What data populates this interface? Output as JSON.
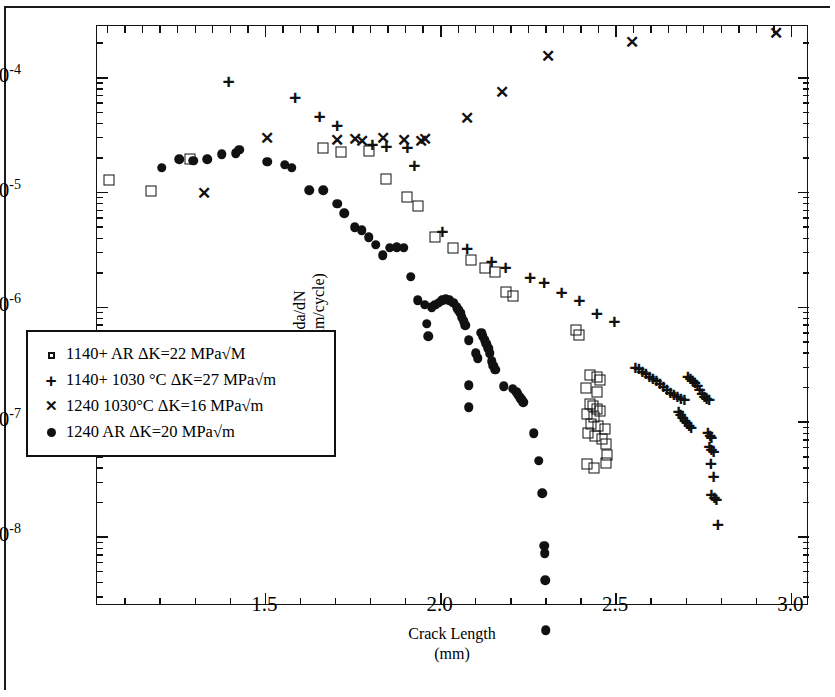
{
  "chart_data": {
    "type": "scatter",
    "title": "",
    "xlabel": "Crack Length",
    "xlabel_unit": "(mm)",
    "ylabel": "da/dN",
    "ylabel_unit": "(mm/cycle)",
    "xlim": [
      1.02,
      3.05
    ],
    "ylim_exp": [
      -8.6,
      -3.55
    ],
    "xscale": "linear",
    "yscale": "log",
    "grid": false,
    "legend_position": "lower-left-inside",
    "x_ticks_major": [
      1.5,
      2.0,
      2.5,
      3.0
    ],
    "x_tick_labels": [
      "1.5",
      "2.0",
      "2.5",
      "3.0"
    ],
    "x_ticks_minor": [
      1.1,
      1.2,
      1.3,
      1.4,
      1.6,
      1.7,
      1.8,
      1.9,
      2.1,
      2.2,
      2.3,
      2.4,
      2.6,
      2.7,
      2.8,
      2.9
    ],
    "y_ticks_major_exp": [
      -4,
      -5,
      -6,
      -7,
      -8
    ],
    "y_tick_labels": [
      "10-4",
      "10-5",
      "10-6",
      "10-7",
      "10-8"
    ],
    "series": [
      {
        "name": "1140+ AR ΔK=22 MPa√M",
        "marker": "open-square",
        "points": [
          [
            1.055,
            1.28e-05
          ],
          [
            1.175,
            1.03e-05
          ],
          [
            1.285,
            1.95e-05
          ],
          [
            1.665,
            2.45e-05
          ],
          [
            1.715,
            2.25e-05
          ],
          [
            1.795,
            2.3e-05
          ],
          [
            1.845,
            1.3e-05
          ],
          [
            1.905,
            9.2e-06
          ],
          [
            1.935,
            7.6e-06
          ],
          [
            1.985,
            4.1e-06
          ],
          [
            2.035,
            3.3e-06
          ],
          [
            2.085,
            2.6e-06
          ],
          [
            2.125,
            2.2e-06
          ],
          [
            2.155,
            2.05e-06
          ],
          [
            2.185,
            1.35e-06
          ],
          [
            2.205,
            1.25e-06
          ],
          [
            2.385,
            6.4e-07
          ],
          [
            2.395,
            5.8e-07
          ],
          [
            2.425,
            2.6e-07
          ],
          [
            2.445,
            2.5e-07
          ],
          [
            2.455,
            2.35e-07
          ],
          [
            2.415,
            2e-07
          ],
          [
            2.445,
            1.85e-07
          ],
          [
            2.425,
            1.45e-07
          ],
          [
            2.435,
            1.38e-07
          ],
          [
            2.445,
            1.3e-07
          ],
          [
            2.455,
            1.26e-07
          ],
          [
            2.418,
            1.18e-07
          ],
          [
            2.438,
            1.12e-07
          ],
          [
            2.428,
            9.6e-08
          ],
          [
            2.448,
            9.2e-08
          ],
          [
            2.468,
            8.8e-08
          ],
          [
            2.42,
            8e-08
          ],
          [
            2.44,
            7.6e-08
          ],
          [
            2.46,
            7.2e-08
          ],
          [
            2.472,
            6.4e-08
          ],
          [
            2.475,
            5.2e-08
          ],
          [
            2.418,
            4.3e-08
          ],
          [
            2.438,
            4e-08
          ],
          [
            2.472,
            4.4e-08
          ]
        ]
      },
      {
        "name": "1140+ 1030 °C ΔK=27 MPa√m",
        "marker": "plus",
        "points": [
          [
            1.395,
            9.3e-05
          ],
          [
            1.585,
            6.8e-05
          ],
          [
            1.655,
            4.6e-05
          ],
          [
            1.705,
            3.9e-05
          ],
          [
            1.805,
            2.65e-05
          ],
          [
            1.845,
            2.55e-05
          ],
          [
            1.905,
            2.5e-05
          ],
          [
            1.925,
            1.75e-05
          ],
          [
            2.005,
            4.6e-06
          ],
          [
            2.075,
            3.3e-06
          ],
          [
            2.145,
            2.55e-06
          ],
          [
            2.185,
            2.25e-06
          ],
          [
            2.255,
            1.85e-06
          ],
          [
            2.295,
            1.65e-06
          ],
          [
            2.345,
            1.35e-06
          ],
          [
            2.395,
            1.15e-06
          ],
          [
            2.445,
            9e-07
          ],
          [
            2.495,
            7.6e-07
          ],
          [
            2.555,
            3.05e-07
          ],
          [
            2.565,
            2.95e-07
          ],
          [
            2.575,
            2.8e-07
          ],
          [
            2.585,
            2.7e-07
          ],
          [
            2.595,
            2.55e-07
          ],
          [
            2.605,
            2.45e-07
          ],
          [
            2.615,
            2.35e-07
          ],
          [
            2.625,
            2.2e-07
          ],
          [
            2.635,
            2.05e-07
          ],
          [
            2.645,
            1.95e-07
          ],
          [
            2.655,
            1.85e-07
          ],
          [
            2.665,
            1.75e-07
          ],
          [
            2.675,
            1.7e-07
          ],
          [
            2.685,
            1.62e-07
          ],
          [
            2.695,
            1.58e-07
          ],
          [
            2.705,
            2.55e-07
          ],
          [
            2.712,
            2.45e-07
          ],
          [
            2.718,
            2.35e-07
          ],
          [
            2.725,
            2.25e-07
          ],
          [
            2.732,
            2.1e-07
          ],
          [
            2.738,
            1.95e-07
          ],
          [
            2.745,
            1.8e-07
          ],
          [
            2.752,
            1.7e-07
          ],
          [
            2.758,
            1.62e-07
          ],
          [
            2.765,
            1.58e-07
          ],
          [
            2.678,
            1.25e-07
          ],
          [
            2.684,
            1.18e-07
          ],
          [
            2.69,
            1.12e-07
          ],
          [
            2.696,
            1.05e-07
          ],
          [
            2.702,
            1e-07
          ],
          [
            2.708,
            9.5e-08
          ],
          [
            2.714,
            9e-08
          ],
          [
            2.762,
            8.2e-08
          ],
          [
            2.768,
            7.8e-08
          ],
          [
            2.772,
            7.4e-08
          ],
          [
            2.766,
            6.2e-08
          ],
          [
            2.772,
            5.9e-08
          ],
          [
            2.778,
            5.6e-08
          ],
          [
            2.77,
            4.4e-08
          ],
          [
            2.778,
            3.4e-08
          ],
          [
            2.772,
            2.35e-08
          ],
          [
            2.78,
            2.25e-08
          ],
          [
            2.786,
            2.15e-08
          ],
          [
            2.79,
            1.3e-08
          ]
        ]
      },
      {
        "name": "1240 1030°C ΔK=16 MPa√m",
        "marker": "x",
        "points": [
          [
            1.325,
            1e-05
          ],
          [
            1.505,
            3e-05
          ],
          [
            1.705,
            2.85e-05
          ],
          [
            1.755,
            2.95e-05
          ],
          [
            1.775,
            2.8e-05
          ],
          [
            1.835,
            3e-05
          ],
          [
            1.895,
            2.85e-05
          ],
          [
            1.945,
            2.8e-05
          ],
          [
            1.955,
            2.95e-05
          ],
          [
            2.075,
            4.5e-05
          ],
          [
            2.175,
            7.5e-05
          ],
          [
            2.305,
            0.000155
          ],
          [
            2.545,
            0.000205
          ],
          [
            2.955,
            0.000245
          ]
        ]
      },
      {
        "name": "1240 AR ΔK=20 MPa√m",
        "marker": "filled-circle",
        "points": [
          [
            1.205,
            1.65e-05
          ],
          [
            1.255,
            1.95e-05
          ],
          [
            1.295,
            1.9e-05
          ],
          [
            1.335,
            1.95e-05
          ],
          [
            1.375,
            2.15e-05
          ],
          [
            1.415,
            2.2e-05
          ],
          [
            1.425,
            2.35e-05
          ],
          [
            1.505,
            1.85e-05
          ],
          [
            1.555,
            1.75e-05
          ],
          [
            1.575,
            1.65e-05
          ],
          [
            1.625,
            1.05e-05
          ],
          [
            1.665,
            1.05e-05
          ],
          [
            1.705,
            8e-06
          ],
          [
            1.725,
            6.6e-06
          ],
          [
            1.755,
            5e-06
          ],
          [
            1.775,
            4.7e-06
          ],
          [
            1.795,
            4.1e-06
          ],
          [
            1.815,
            3.5e-06
          ],
          [
            1.835,
            2.85e-06
          ],
          [
            1.855,
            3.3e-06
          ],
          [
            1.875,
            3.35e-06
          ],
          [
            1.895,
            3.3e-06
          ],
          [
            1.915,
            1.85e-06
          ],
          [
            1.935,
            1.15e-06
          ],
          [
            1.955,
            1.05e-06
          ],
          [
            1.975,
            1e-06
          ],
          [
            1.985,
            1.05e-06
          ],
          [
            1.995,
            1.1e-06
          ],
          [
            2.005,
            1.15e-06
          ],
          [
            2.015,
            1.18e-06
          ],
          [
            2.025,
            1.15e-06
          ],
          [
            2.035,
            1.1e-06
          ],
          [
            2.045,
            1e-06
          ],
          [
            2.05,
            9.5e-07
          ],
          [
            2.055,
            9e-07
          ],
          [
            2.06,
            8.2e-07
          ],
          [
            2.065,
            7.6e-07
          ],
          [
            2.07,
            7e-07
          ],
          [
            1.96,
            7.2e-07
          ],
          [
            1.965,
            5.6e-07
          ],
          [
            2.08,
            5.2e-07
          ],
          [
            2.115,
            6e-07
          ],
          [
            2.12,
            5.6e-07
          ],
          [
            2.125,
            5.2e-07
          ],
          [
            2.13,
            4.8e-07
          ],
          [
            2.135,
            4.4e-07
          ],
          [
            2.14,
            4e-07
          ],
          [
            2.1,
            4e-07
          ],
          [
            2.105,
            3.6e-07
          ],
          [
            2.145,
            3.4e-07
          ],
          [
            2.15,
            3.1e-07
          ],
          [
            2.155,
            2.85e-07
          ],
          [
            2.08,
            2.1e-07
          ],
          [
            2.18,
            2.05e-07
          ],
          [
            2.205,
            1.95e-07
          ],
          [
            2.215,
            1.85e-07
          ],
          [
            2.22,
            1.75e-07
          ],
          [
            2.225,
            1.65e-07
          ],
          [
            2.23,
            1.58e-07
          ],
          [
            2.235,
            1.5e-07
          ],
          [
            2.08,
            1.35e-07
          ],
          [
            2.265,
            8e-08
          ],
          [
            2.28,
            4.6e-08
          ],
          [
            2.29,
            2.4e-08
          ],
          [
            2.295,
            8.4e-09
          ],
          [
            2.296,
            7.2e-09
          ],
          [
            2.298,
            4.2e-09
          ],
          [
            2.3,
            1.55e-09
          ]
        ]
      }
    ]
  }
}
